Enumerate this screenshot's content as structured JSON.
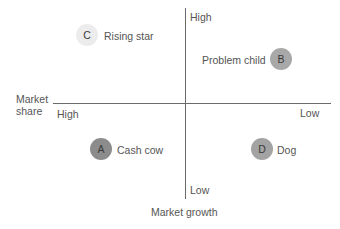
{
  "diagram": {
    "type": "BCG growth-share matrix",
    "x_axis": {
      "label_line1": "Market",
      "label_line2": "share",
      "high_label": "High",
      "low_label": "Low"
    },
    "y_axis": {
      "label": "Market growth",
      "high_label": "High",
      "low_label": "Low"
    },
    "quadrants": [
      {
        "letter": "C",
        "label": "Rising star",
        "position": "top-left",
        "color": "#ececec"
      },
      {
        "letter": "B",
        "label": "Problem child",
        "position": "top-right",
        "color": "#a8a8a8"
      },
      {
        "letter": "A",
        "label": "Cash cow",
        "position": "bottom-left",
        "color": "#8c8c8c"
      },
      {
        "letter": "D",
        "label": "Dog",
        "position": "bottom-right",
        "color": "#a3a3a3"
      }
    ]
  }
}
